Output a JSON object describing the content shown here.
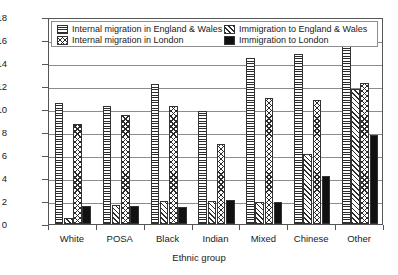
{
  "chart_data": {
    "type": "bar",
    "title": "",
    "xlabel": "Ethnic group",
    "ylabel": "Migration rate (%)",
    "ylim": [
      0,
      18
    ],
    "ytick_labels": [
      "0",
      "2",
      "4",
      "6",
      "8",
      "10",
      "12",
      "14",
      "16",
      "18"
    ],
    "ytick_values": [
      0,
      2,
      4,
      6,
      8,
      10,
      12,
      14,
      16,
      18
    ],
    "grid": "horizontal",
    "legend_position": "top-inside",
    "categories": [
      "White",
      "POSA",
      "Black",
      "Indian",
      "Mixed",
      "Chinese",
      "Other"
    ],
    "series": [
      {
        "name": "Internal migration in England & Wales",
        "pattern": "horizontal-lines",
        "values": [
          10.5,
          10.3,
          12.15,
          9.8,
          14.4,
          14.8,
          15.6
        ]
      },
      {
        "name": "Immigration to England & Wales",
        "pattern": "diagonal-hatch",
        "values": [
          0.55,
          1.65,
          2.0,
          2.0,
          1.95,
          6.1,
          11.7
        ]
      },
      {
        "name": "Internal migration in London",
        "pattern": "crosshatch",
        "values": [
          8.7,
          9.5,
          10.25,
          7.0,
          10.95,
          10.8,
          12.3
        ]
      },
      {
        "name": "Immigration to London",
        "pattern": "solid-black",
        "values": [
          1.6,
          1.6,
          1.45,
          2.05,
          1.9,
          4.15,
          7.7
        ]
      }
    ]
  },
  "legend": {
    "entries": [
      {
        "label": "Internal migration in England & Wales",
        "pattern": "horizontal-lines"
      },
      {
        "label": "Immigration to England & Wales",
        "pattern": "diagonal-hatch"
      },
      {
        "label": "Internal migration in London",
        "pattern": "crosshatch"
      },
      {
        "label": "Immigration to London",
        "pattern": "solid-black"
      }
    ]
  },
  "colors": {
    "axis": "#555555",
    "grid": "#8c8c8c",
    "ink": "#2b2b2b",
    "solid_bar": "#111111",
    "background": "#ffffff"
  }
}
